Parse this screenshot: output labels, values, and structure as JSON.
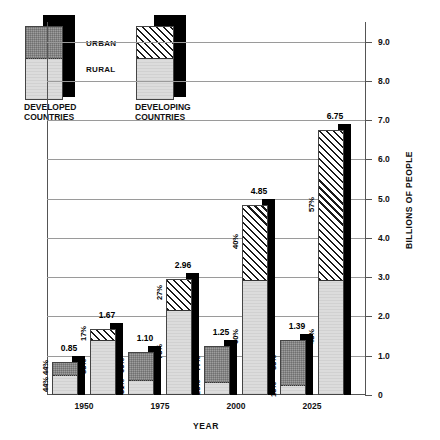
{
  "chart_data": {
    "type": "bar",
    "title": "",
    "xlabel": "YEAR",
    "ylabel": "BILLIONS OF PEOPLE",
    "ylim": [
      0,
      9.5
    ],
    "grid": true,
    "legend_position": "top-left",
    "categories": [
      "1950",
      "1975",
      "2000",
      "2025"
    ],
    "ytick_labels": [
      "0",
      "1.0",
      "2.0",
      "3.0",
      "4.0",
      "5.0",
      "6.0",
      "7.0",
      "8.0",
      "9.0"
    ],
    "ytick_values": [
      0,
      1,
      2,
      3,
      4,
      5,
      6,
      7,
      8,
      9
    ],
    "series": [
      {
        "name": "DEVELOPED COUNTRIES",
        "values": [
          0.85,
          1.1,
          1.25,
          1.39
        ],
        "urban_pct": [
          "44%",
          "69%",
          "77%",
          "85%"
        ],
        "rural_pct": [
          "44%",
          "31%",
          "23%",
          "15%"
        ],
        "value_labels": [
          "0.85",
          "1.10",
          "1.25",
          "1.39"
        ]
      },
      {
        "name": "DEVELOPING COUNTRIES",
        "values": [
          1.67,
          2.96,
          4.85,
          6.75
        ],
        "urban_pct": [
          "17%",
          "27%",
          "40%",
          "57%"
        ],
        "rural_pct": [
          "83%",
          "73%",
          "60%",
          "43%"
        ],
        "value_labels": [
          "1.67",
          "2.96",
          "4.85",
          "6.75"
        ]
      }
    ]
  },
  "legend": {
    "urban_label": "URBAN",
    "rural_label": "RURAL",
    "developed_caption_line1": "DEVELOPED",
    "developed_caption_line2": "COUNTRIES",
    "developing_caption_line1": "DEVELOPING",
    "developing_caption_line2": "COUNTRIES"
  },
  "colors": {
    "urban_developed": "#9e9e9e",
    "urban_developing_hatch": "#1a1a1a",
    "rural": "#dcdcdc",
    "shadow": "#000000",
    "grid": "#9a9a9a",
    "axis": "#555555"
  },
  "axis": {
    "y_title": "BILLIONS OF PEOPLE",
    "x_title": "YEAR"
  }
}
